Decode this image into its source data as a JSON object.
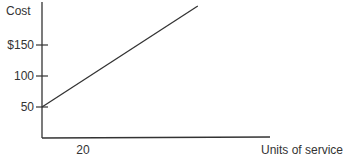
{
  "chart_data": {
    "type": "line",
    "title": "",
    "xlabel": "Units of service",
    "ylabel": "Cost",
    "xlim": [
      0,
      110
    ],
    "ylim": [
      0,
      215
    ],
    "grid": false,
    "legend": null,
    "x_ticks": [
      {
        "value": 20,
        "label": "20",
        "tick_mark": false
      }
    ],
    "y_ticks": [
      {
        "value": 50,
        "label": "50"
      },
      {
        "value": 100,
        "label": "100"
      },
      {
        "value": 150,
        "label": "$150"
      }
    ],
    "series": [
      {
        "name": "Cost",
        "x": [
          0,
          76
        ],
        "y": [
          50,
          213
        ]
      }
    ],
    "colors": {
      "axis": "#333333",
      "line": "#333333",
      "text": "#333333"
    }
  }
}
